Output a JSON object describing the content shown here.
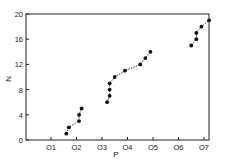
{
  "chart_data": {
    "type": "scatter",
    "title": "",
    "xlabel": "P",
    "ylabel": "N",
    "xlim": [
      0.0,
      0.74
    ],
    "ylim": [
      0,
      20
    ],
    "grid": false,
    "legend": null,
    "x_ticks": [
      0.1,
      0.2,
      0.3,
      0.4,
      0.5,
      0.6,
      0.7
    ],
    "x_tick_labels": [
      "O1",
      "O2",
      "O3",
      "O4",
      "O5",
      "O6",
      "O7"
    ],
    "y_ticks": [
      0,
      4,
      8,
      12,
      16,
      20
    ],
    "y_tick_labels": [
      "0",
      "4",
      "8",
      "12",
      "16",
      "20"
    ],
    "series": [
      {
        "name": "group-1",
        "connected": "dashed",
        "points": [
          [
            0.16,
            1
          ],
          [
            0.17,
            2
          ],
          [
            0.21,
            3
          ],
          [
            0.21,
            4
          ],
          [
            0.22,
            5
          ]
        ]
      },
      {
        "name": "group-2",
        "connected": "dashed",
        "points": [
          [
            0.32,
            6
          ],
          [
            0.33,
            7
          ],
          [
            0.33,
            8
          ],
          [
            0.33,
            9
          ],
          [
            0.35,
            10
          ],
          [
            0.39,
            11
          ],
          [
            0.45,
            12
          ],
          [
            0.47,
            13
          ],
          [
            0.49,
            14
          ]
        ]
      },
      {
        "name": "group-3",
        "connected": "dashed",
        "points": [
          [
            0.65,
            15
          ],
          [
            0.67,
            16
          ],
          [
            0.67,
            17
          ],
          [
            0.69,
            18
          ],
          [
            0.72,
            19
          ]
        ]
      }
    ],
    "colors": {
      "marker": "#111111",
      "axis": "#222222",
      "background": "#ffffff"
    }
  }
}
